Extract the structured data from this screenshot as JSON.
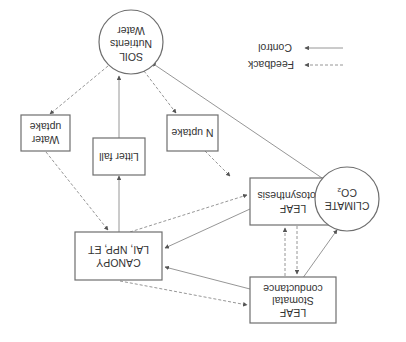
{
  "diagram": {
    "orientation": "rotated 180 degrees",
    "nodes": {
      "soil": {
        "lines": [
          "SOIL",
          "Nutrients",
          "Water"
        ],
        "shape": "circle"
      },
      "climate": {
        "lines": [
          "CLIMATE",
          "CO₂"
        ],
        "shape": "circle"
      },
      "water_uptake": {
        "lines": [
          "Water",
          "uptake"
        ],
        "shape": "box"
      },
      "litter_fall": {
        "lines": [
          "Litter fall"
        ],
        "shape": "box"
      },
      "n_uptake": {
        "lines": [
          "N uptake"
        ],
        "shape": "box"
      },
      "canopy": {
        "lines": [
          "CANOPY",
          "LAI, NPP, ET"
        ],
        "shape": "box"
      },
      "leaf_photosynthesis": {
        "lines": [
          "LEAF",
          "Photosynthesis"
        ],
        "shape": "box"
      },
      "leaf_stomatal": {
        "lines": [
          "LEAF",
          "Stomatal",
          "conductance"
        ],
        "shape": "box"
      }
    },
    "edges": [
      {
        "from": "CLIMATE",
        "to": "SOIL",
        "type": "control"
      },
      {
        "from": "CLIMATE",
        "to": "LEAF Photosynthesis",
        "type": "control"
      },
      {
        "from": "CLIMATE",
        "to": "LEAF Stomatal conductance",
        "type": "control"
      },
      {
        "from": "SOIL",
        "to": "Water uptake",
        "type": "feedback"
      },
      {
        "from": "SOIL",
        "to": "N uptake",
        "type": "feedback"
      },
      {
        "from": "Litter fall",
        "to": "SOIL",
        "type": "control"
      },
      {
        "from": "CANOPY",
        "to": "Litter fall",
        "type": "control"
      },
      {
        "from": "Water uptake",
        "to": "CANOPY",
        "type": "feedback"
      },
      {
        "from": "N uptake",
        "to": "LEAF Photosynthesis",
        "type": "feedback"
      },
      {
        "from": "LEAF Photosynthesis",
        "to": "CANOPY",
        "type": "control"
      },
      {
        "from": "CANOPY",
        "to": "LEAF Photosynthesis",
        "type": "feedback"
      },
      {
        "from": "LEAF Stomatal conductance",
        "to": "CANOPY",
        "type": "control"
      },
      {
        "from": "CANOPY",
        "to": "LEAF Stomatal conductance",
        "type": "feedback"
      },
      {
        "from": "LEAF Photosynthesis",
        "to": "LEAF Stomatal conductance",
        "type": "feedback"
      },
      {
        "from": "LEAF Stomatal conductance",
        "to": "LEAF Photosynthesis",
        "type": "feedback"
      }
    ],
    "legend": {
      "control": "Control",
      "feedback": "Feedback"
    }
  }
}
